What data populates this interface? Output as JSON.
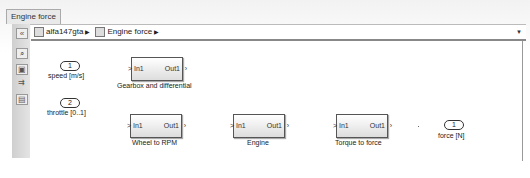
{
  "window": {
    "tab_label": "Engine force",
    "breadcrumb": [
      {
        "label": "alfa147gta"
      },
      {
        "label": "Engine force"
      }
    ],
    "toolbar_icons": [
      "hide-browser-icon",
      "zoom-icon",
      "fit-view-icon",
      "arrow-icon",
      "annotation-icon"
    ]
  },
  "diagram": {
    "inports": [
      {
        "number": "1",
        "label": "speed [m/s]"
      },
      {
        "number": "2",
        "label": "throttle [0..1]"
      }
    ],
    "outports": [
      {
        "number": "1",
        "label": "force [N]"
      }
    ],
    "blocks": [
      {
        "name": "Gearbox and differential",
        "in": "In1",
        "out": "Out1"
      },
      {
        "name": "Wheel to RPM",
        "in": "In1",
        "out": "Out1"
      },
      {
        "name": "Engine",
        "in": "In1",
        "out": "Out1"
      },
      {
        "name": "Torque to force",
        "in": "In1",
        "out": "Out1"
      }
    ]
  }
}
